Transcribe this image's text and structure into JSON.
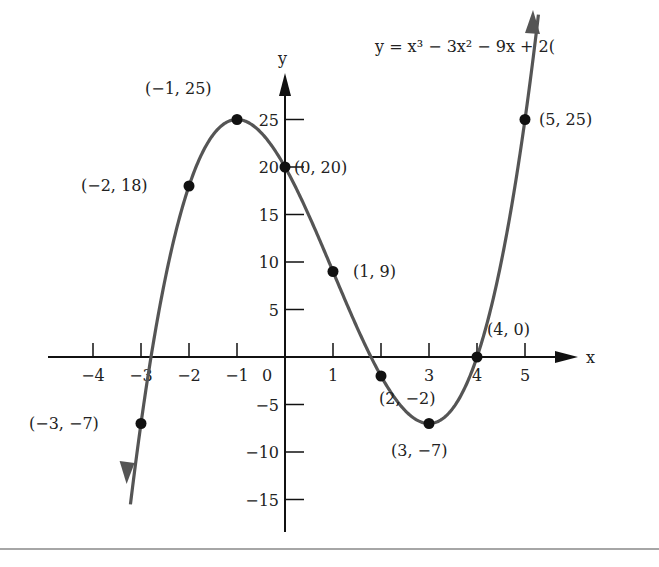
{
  "chart_data": {
    "type": "line",
    "equation_visible": "y = x³ − 3x² − 9x + 2(",
    "xlabel": "x",
    "ylabel": "y",
    "xlim": [
      -4.5,
      6
    ],
    "ylim": [
      -18,
      28
    ],
    "grid": false,
    "x_ticks": [
      -4,
      -3,
      -2,
      -1,
      0,
      1,
      3,
      4,
      5
    ],
    "x_tick_labels": [
      "−4",
      "−3",
      "−2",
      "−1",
      "0",
      "1",
      "3",
      "4",
      "5"
    ],
    "y_ticks": [
      25,
      20,
      15,
      10,
      5,
      -5,
      -10,
      -15
    ],
    "y_tick_labels": [
      "25",
      "20",
      "15",
      "10",
      "5",
      "−5",
      "−10",
      "−15"
    ],
    "points": [
      {
        "x": -3,
        "y": -7,
        "label": "(−3, −7)"
      },
      {
        "x": -2,
        "y": 18,
        "label": "(−2, 18)"
      },
      {
        "x": -1,
        "y": 25,
        "label": "(−1, 25)"
      },
      {
        "x": 0,
        "y": 20,
        "label": "(0, 20)"
      },
      {
        "x": 1,
        "y": 9,
        "label": "(1, 9)"
      },
      {
        "x": 2,
        "y": -2,
        "label": "(2, −2)"
      },
      {
        "x": 3,
        "y": -7,
        "label": "(3, −7)"
      },
      {
        "x": 4,
        "y": 0,
        "label": "(4, 0)"
      },
      {
        "x": 5,
        "y": 25,
        "label": "(5, 25)"
      }
    ],
    "curve_color": "#555555",
    "point_color": "#111111",
    "axis_color": "#111111"
  }
}
